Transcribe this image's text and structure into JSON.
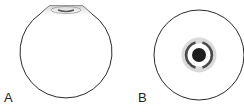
{
  "figure": {
    "panels": [
      {
        "label": "A",
        "description": "side view of spherical globe with flattened top cap"
      },
      {
        "label": "B",
        "description": "top view of globe with concentric ring and central dark circle"
      }
    ],
    "colors": {
      "outline": "#2a2a2a",
      "cap_shade": "#d8d8d8",
      "ring_light": "#d9d9d9",
      "ring_dark": "#4a4a4a",
      "center": "#1e1e1e"
    }
  }
}
